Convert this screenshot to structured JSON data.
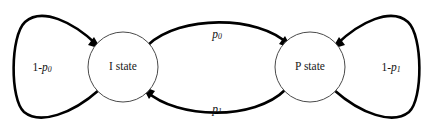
{
  "diagram": {
    "type": "state-transition-diagram",
    "nodes": [
      {
        "id": "i-state",
        "label": "I state",
        "cx": 123,
        "cy": 67,
        "r": 35
      },
      {
        "id": "p-state",
        "label": "P state",
        "cx": 310,
        "cy": 67,
        "r": 35
      }
    ],
    "edges": [
      {
        "id": "i-to-p",
        "from": "I state",
        "to": "P state",
        "label_base": "p",
        "label_sub": "0",
        "label_x": 217,
        "label_y": 35,
        "position": "top"
      },
      {
        "id": "p-to-i",
        "from": "P state",
        "to": "I state",
        "label_base": "p",
        "label_sub": "1",
        "label_x": 217,
        "label_y": 110,
        "position": "bottom"
      },
      {
        "id": "i-self-loop",
        "from": "I state",
        "to": "I state",
        "label_prefix": "1-",
        "label_base": "p",
        "label_sub": "0",
        "label_x": 42,
        "label_y": 68,
        "position": "left"
      },
      {
        "id": "p-self-loop",
        "from": "P state",
        "to": "P state",
        "label_prefix": "1-",
        "label_base": "p",
        "label_sub": "1",
        "label_x": 391,
        "label_y": 68,
        "position": "right"
      }
    ],
    "colors": {
      "background": "#ffffff",
      "edge_stroke": "#000000",
      "node_stroke": "#4a4a4a",
      "text": "#111111"
    }
  }
}
